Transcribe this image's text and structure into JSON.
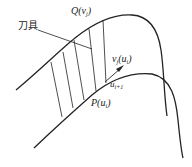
{
  "diagram": {
    "labels": {
      "tool": "刀具",
      "q_curve": {
        "main": "Q(v",
        "sub": "j",
        "close": ")"
      },
      "v_vector": {
        "main": "v",
        "sub1": "j",
        "mid": "(u",
        "sub2": "i",
        "close": ")"
      },
      "u_next": {
        "main": "u",
        "sub": "i+1"
      },
      "p_curve": {
        "main": "P(u",
        "sub": "i",
        "close": ")"
      }
    },
    "colors": {
      "stroke": "#222222",
      "background": "#ffffff"
    }
  }
}
